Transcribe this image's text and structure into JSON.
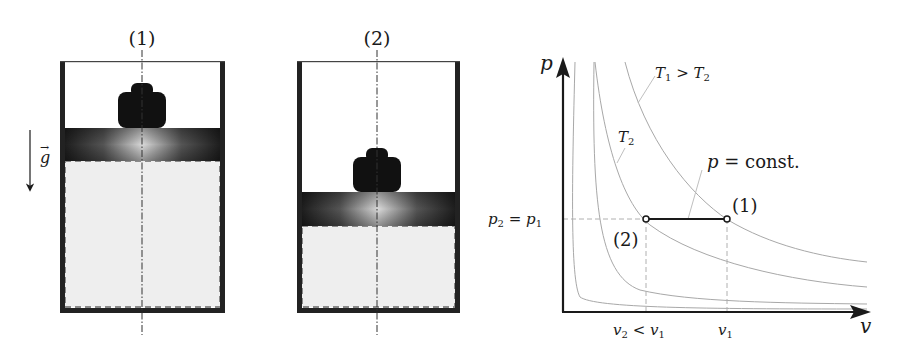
{
  "figure": {
    "colors": {
      "ink": "#1a1a1a",
      "wall": "#222222",
      "gas_fill": "#eeeeee",
      "gas_border": "#8a8a8a",
      "isotherm": "#a8a8a8",
      "guide": "#b0b0b0"
    }
  },
  "cylinder_1": {
    "label": "(1)"
  },
  "cylinder_2": {
    "label": "(2)"
  },
  "gravity": {
    "label": "g",
    "arrow": "→"
  },
  "pv_diagram": {
    "y_axis_label": "p",
    "x_axis_label": "v",
    "p_tick_label": {
      "lhs": "p",
      "lhs_sub": "2",
      "eq": " = ",
      "rhs": "p",
      "rhs_sub": "1"
    },
    "v2_tick_label": {
      "a": "v",
      "a_sub": "2",
      "op": " < ",
      "b": "v",
      "b_sub": "1"
    },
    "v1_tick_label": {
      "a": "v",
      "a_sub": "1"
    },
    "isotherm_T1_label": {
      "a": "T",
      "a_sub": "1",
      "op": " > ",
      "b": "T",
      "b_sub": "2"
    },
    "isotherm_T2_label": {
      "a": "T",
      "a_sub": "2"
    },
    "process_label": {
      "a": "p",
      "rest": " = const."
    },
    "state_1_label": "(1)",
    "state_2_label": "(2)"
  }
}
